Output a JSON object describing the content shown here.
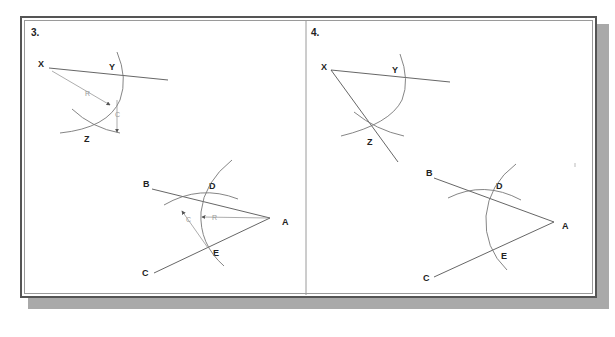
{
  "panels": [
    {
      "number": "3.",
      "points": {
        "X": "X",
        "Y": "Y",
        "Z": "Z",
        "A": "A",
        "B": "B",
        "C": "C",
        "D": "D",
        "E": "E"
      },
      "dimensions": {
        "radius_r": "R",
        "chord_c": "C",
        "radius_r2": "R",
        "chord_c2": "C"
      }
    },
    {
      "number": "4.",
      "points": {
        "X": "X",
        "Y": "Y",
        "Z": "Z",
        "A": "A",
        "B": "B",
        "C": "C",
        "D": "D",
        "E": "E"
      }
    }
  ],
  "colors": {
    "frame": "#555555",
    "shadow": "#a9a9a9",
    "lines": "#555555",
    "arcs": "#777777",
    "dimensions": "#9a9a9a"
  }
}
